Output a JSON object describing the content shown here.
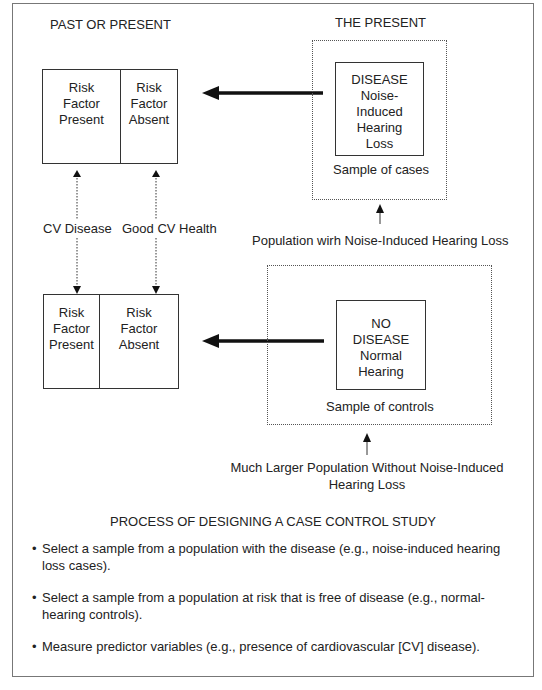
{
  "headings": {
    "past_or_present": "PAST OR PRESENT",
    "the_present": "THE PRESENT"
  },
  "top_risk_table": {
    "left": [
      "Risk",
      "Factor",
      "Present"
    ],
    "right": [
      "Risk",
      "Factor",
      "Absent"
    ]
  },
  "bottom_risk_table": {
    "left": [
      "Risk",
      "Factor",
      "Present"
    ],
    "right": [
      "Risk",
      "Factor",
      "Absent"
    ]
  },
  "disease_box": {
    "lines": [
      "DISEASE",
      "Noise-",
      "Induced",
      "Hearing",
      "Loss"
    ],
    "caption": "Sample of cases"
  },
  "no_disease_box": {
    "lines": [
      "NO",
      "DISEASE",
      "Normal",
      "Hearing"
    ],
    "caption": "Sample of controls"
  },
  "labels": {
    "cv_disease": "CV Disease",
    "good_cv_health": "Good CV Health",
    "population_cases": "Population wirh Noise-Induced Hearing Loss",
    "population_controls_line1": "Much Larger Population Without Noise-Induced",
    "population_controls_line2": "Hearing Loss"
  },
  "process": {
    "title": "PROCESS OF DESIGNING A CASE CONTROL STUDY",
    "steps": [
      "Select a sample from a population with the disease (e.g., noise-induced hearing loss cases).",
      "Select a sample from a population at risk that is free of disease (e.g., normal-hearing controls).",
      "Measure predictor variables (e.g., presence of cardiovascular [CV] disease)."
    ]
  }
}
